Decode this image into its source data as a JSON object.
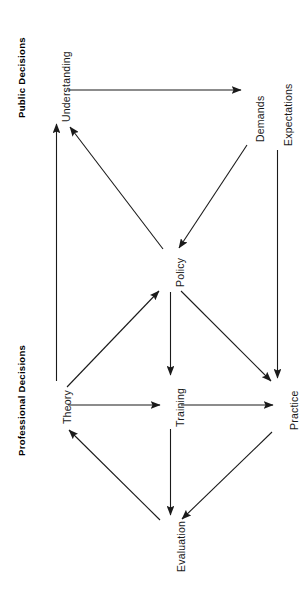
{
  "figure": {
    "title": "",
    "orientation": "rotated-90-ccw",
    "background_color": "#ffffff",
    "line_color": "#1a1a1a"
  },
  "groups": [
    {
      "id": "public",
      "label": "Public Decisions"
    },
    {
      "id": "professional",
      "label": "Professional Decisions"
    }
  ],
  "nodes": [
    {
      "id": "understanding",
      "label": "Understanding",
      "group": "public"
    },
    {
      "id": "demands",
      "label": "Demands",
      "group": "public"
    },
    {
      "id": "expectations",
      "label": "Expectations",
      "group": "public"
    },
    {
      "id": "policy",
      "label": "Policy",
      "group": "public"
    },
    {
      "id": "theory",
      "label": "Theory",
      "group": "professional"
    },
    {
      "id": "training",
      "label": "Training",
      "group": "professional"
    },
    {
      "id": "practice",
      "label": "Practice",
      "group": "professional"
    },
    {
      "id": "evaluation",
      "label": "Evaluation",
      "group": "professional"
    }
  ],
  "edges": [
    {
      "from": "understanding",
      "to": "demands"
    },
    {
      "from": "demands",
      "to": "policy"
    },
    {
      "from": "policy",
      "to": "understanding"
    },
    {
      "from": "theory",
      "to": "understanding"
    },
    {
      "from": "expectations",
      "to": "practice"
    },
    {
      "from": "theory",
      "to": "policy"
    },
    {
      "from": "policy",
      "to": "training"
    },
    {
      "from": "policy",
      "to": "practice"
    },
    {
      "from": "theory",
      "to": "training"
    },
    {
      "from": "training",
      "to": "practice"
    },
    {
      "from": "training",
      "to": "evaluation"
    },
    {
      "from": "practice",
      "to": "evaluation"
    },
    {
      "from": "evaluation",
      "to": "theory"
    }
  ]
}
